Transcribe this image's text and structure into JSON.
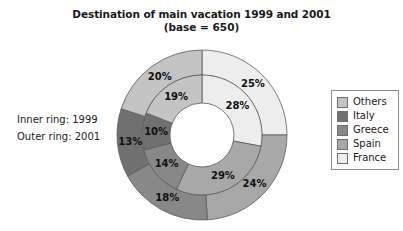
{
  "title": {
    "main": "Destination of main vacation 1999 and 2001",
    "sub": "(base = 650)"
  },
  "annotations": {
    "inner_ring": "Inner ring: 1999",
    "outer_ring": "Outer ring: 2001"
  },
  "legend": {
    "items": [
      {
        "label": "Others",
        "color": "#c4c4c4"
      },
      {
        "label": "Italy",
        "color": "#707070"
      },
      {
        "label": "Greece",
        "color": "#888888"
      },
      {
        "label": "Spain",
        "color": "#a8a8a8"
      },
      {
        "label": "France",
        "color": "#ededed"
      }
    ]
  },
  "chart_data": {
    "type": "pie",
    "variant": "nested-donut",
    "title": "Destination of main vacation 1999 and 2001",
    "subtitle": "(base = 650)",
    "base": 650,
    "units": "percent",
    "start_angle_deg": 0,
    "direction": "clockwise",
    "categories": [
      "France",
      "Spain",
      "Greece",
      "Italy",
      "Others"
    ],
    "colors": [
      "#ededed",
      "#a8a8a8",
      "#888888",
      "#707070",
      "#c4c4c4"
    ],
    "series": [
      {
        "name": "Inner ring: 1999",
        "ring": "inner",
        "values": [
          28,
          29,
          14,
          10,
          19
        ],
        "labels": [
          "28%",
          "29%",
          "14%",
          "10%",
          "19%"
        ]
      },
      {
        "name": "Outer ring: 2001",
        "ring": "outer",
        "values": [
          25,
          24,
          18,
          13,
          20
        ],
        "labels": [
          "25%",
          "24%",
          "18%",
          "13%",
          "20%"
        ]
      }
    ],
    "geometry": {
      "center_x": 202,
      "center_y": 135,
      "hole_radius": 32,
      "inner_ring_outer_radius": 60,
      "outer_ring_outer_radius": 85,
      "inner_label_radius": 46,
      "outer_label_radius": 72
    },
    "legend_position": "right",
    "grid": false
  }
}
